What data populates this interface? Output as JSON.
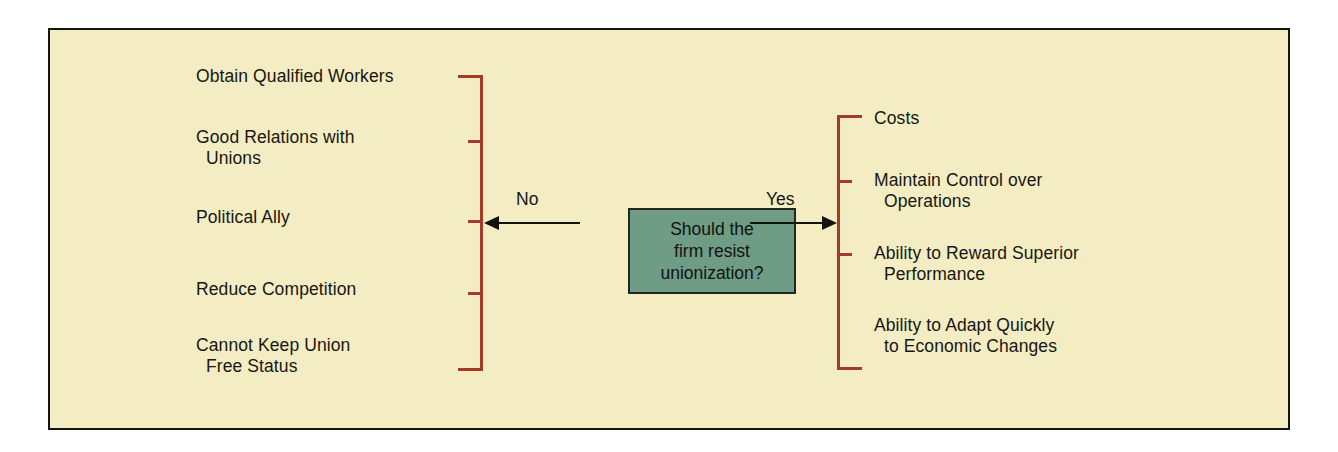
{
  "diagram": {
    "title": "Should the firm resist unionization?",
    "decision_box": {
      "text": "Should the\nfirm resist\nunionization?",
      "fill_color": "#6f9c85",
      "border_color": "#23281f"
    },
    "background_color": "#f4ecc3",
    "frame_color": "#15150f",
    "bracket_color": "#a53a28",
    "connector_color": "#13130d",
    "branches": [
      {
        "label": "No",
        "side": "left",
        "direction": "left",
        "items": [
          "Obtain Qualified Workers",
          "Good Relations with\n  Unions",
          "Political Ally",
          "Reduce Competition",
          "Cannot Keep Union\n  Free Status"
        ]
      },
      {
        "label": "Yes",
        "side": "right",
        "direction": "right",
        "items": [
          "Costs",
          "Maintain Control over\n  Operations",
          "Ability to Reward Superior\n  Performance",
          "Ability to Adapt Quickly\n  to Economic Changes"
        ]
      }
    ]
  }
}
